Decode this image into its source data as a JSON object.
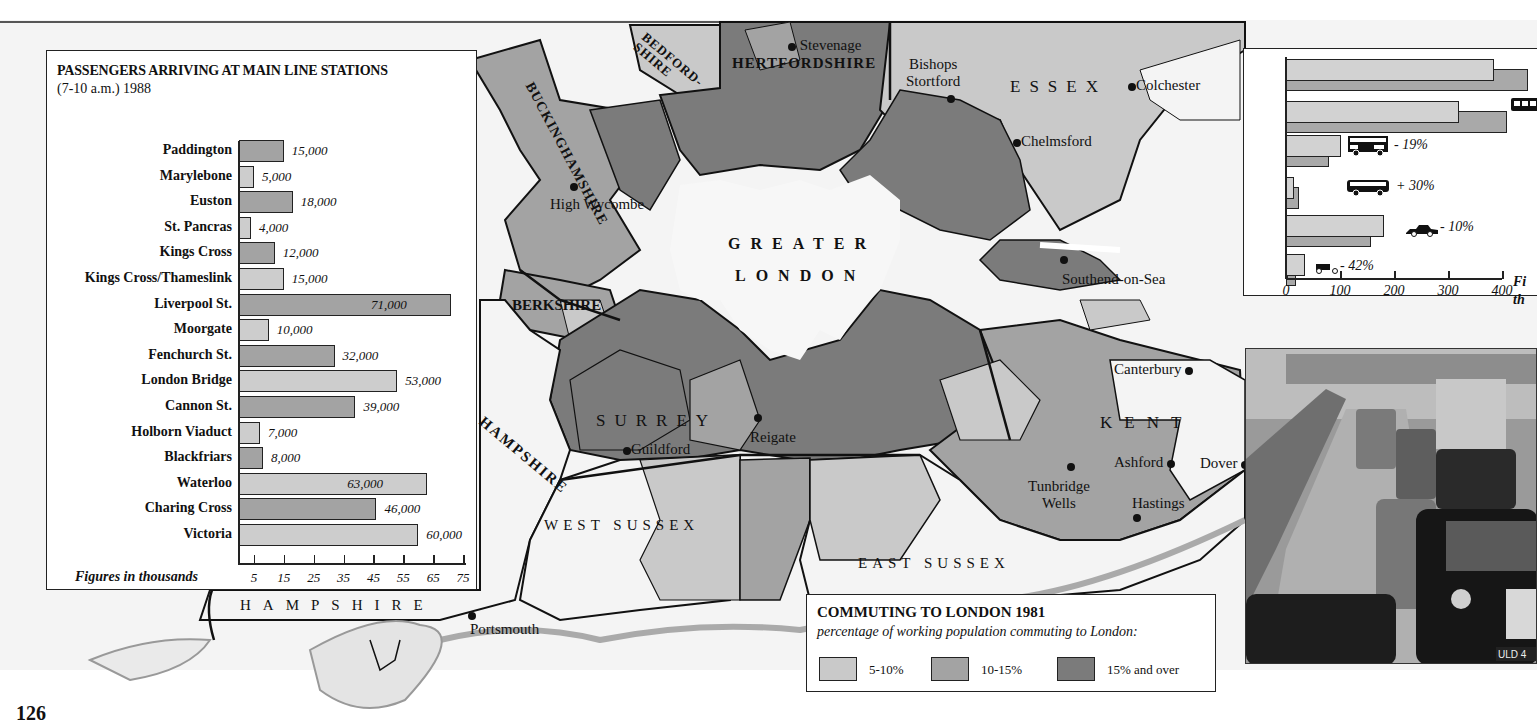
{
  "page": {
    "number": "126"
  },
  "colors": {
    "band_5_10": "#c9c9c9",
    "band_10_15": "#a3a3a3",
    "band_15_plus": "#7b7b7b",
    "greater_london": "#f7f7f7",
    "outside": "#f4f4f4",
    "line": "#111111"
  },
  "map": {
    "counties": {
      "buckinghamshire": "BUCKINGHAMSHIRE",
      "bedfordshire": "BEDFORD-SHIRE",
      "hertfordshire": "HERTFORDSHIRE",
      "essex": "ESSEX",
      "greater_london_1": "GREATER",
      "greater_london_2": "LONDON",
      "berkshire": "BERKSHIRE",
      "surrey": "SURREY",
      "kent": "KENT",
      "hampshire_upper": "HAMPSHIRE",
      "hampshire_lower": "HAMPSHIRE",
      "west_sussex": "WEST SUSSEX",
      "east_sussex": "EAST SUSSEX"
    },
    "towns": {
      "stevenage": "Stevenage",
      "bishops_stortford_1": "Bishops",
      "bishops_stortford_2": "Stortford",
      "colchester": "Colchester",
      "chelmsford": "Chelmsford",
      "high_wycombe": "High Wycombe",
      "southend": "Southend-on-Sea",
      "canterbury": "Canterbury",
      "guildford": "Guildford",
      "reigate": "Reigate",
      "ashford": "Ashford",
      "dover": "Dover",
      "tunbridge_wells_1": "Tunbridge",
      "tunbridge_wells_2": "Wells",
      "hastings": "Hastings",
      "portsmouth": "Portsmouth"
    }
  },
  "legend": {
    "title": "COMMUTING TO LONDON 1981",
    "subtitle": "percentage of working population commuting to London:",
    "items": [
      {
        "label": "5-10%",
        "color": "#c9c9c9"
      },
      {
        "label": "10-15%",
        "color": "#a3a3a3"
      },
      {
        "label": "15% and over",
        "color": "#7b7b7b"
      }
    ]
  },
  "chart_data": [
    {
      "type": "bar",
      "orientation": "horizontal",
      "title": "PASSENGERS ARRIVING AT MAIN LINE STATIONS",
      "subtitle": "(7-10 a.m.) 1988",
      "xlabel": "Figures in thousands",
      "ylabel": "",
      "xlim": [
        0,
        75
      ],
      "xticks": [
        "5",
        "15",
        "25",
        "35",
        "45",
        "55",
        "65",
        "75"
      ],
      "grid": false,
      "categories": [
        "Paddington",
        "Marylebone",
        "Euston",
        "St. Pancras",
        "Kings Cross",
        "Kings Cross/Thameslink",
        "Liverpool St.",
        "Moorgate",
        "Fenchurch St.",
        "London Bridge",
        "Cannon St.",
        "Holborn Viaduct",
        "Blackfriars",
        "Waterloo",
        "Charing Cross",
        "Victoria"
      ],
      "values": [
        15,
        5,
        18,
        4,
        12,
        15,
        71,
        10,
        32,
        53,
        39,
        7,
        8,
        63,
        46,
        60
      ],
      "value_labels": [
        "15,000",
        "5,000",
        "18,000",
        "4,000",
        "12,000",
        "15,000",
        "71,000",
        "10,000",
        "32,000",
        "53,000",
        "39,000",
        "7,000",
        "8,000",
        "63,000",
        "46,000",
        "60,000"
      ],
      "label_inside": [
        false,
        false,
        false,
        false,
        false,
        false,
        true,
        false,
        false,
        false,
        false,
        false,
        false,
        true,
        false,
        false
      ],
      "bar_shades": [
        "dark",
        "light",
        "dark",
        "light",
        "dark",
        "light",
        "dark",
        "light",
        "dark",
        "light",
        "dark",
        "light",
        "dark",
        "light",
        "dark",
        "light"
      ]
    },
    {
      "type": "bar",
      "orientation": "horizontal",
      "title": "",
      "xlabel": "Fi… th… (cropped)",
      "xlim": [
        0,
        400
      ],
      "xticks": [
        "0",
        "100",
        "200",
        "300",
        "400"
      ],
      "grid": false,
      "categories": [
        "(cropped row 1)",
        "rail",
        "bus (double-decker)",
        "coach",
        "car",
        "motorcycle"
      ],
      "series": [
        {
          "name": "earlier year (light)",
          "values": [
            385,
            320,
            102,
            14,
            182,
            35
          ]
        },
        {
          "name": "later year (dark)",
          "values": [
            449,
            409,
            80,
            24,
            158,
            18
          ]
        }
      ],
      "change_labels": [
        "",
        "",
        "-19%",
        "+30%",
        "-10%",
        "-42%"
      ]
    }
  ],
  "transport": {
    "pct_labels": {
      "bus": "- 19%",
      "coach": "+ 30%",
      "car": "- 10%",
      "moto": "- 42%"
    },
    "axis": [
      "0",
      "100",
      "200",
      "300",
      "400"
    ],
    "note_1": "Fi",
    "note_2": "th"
  },
  "photo": {
    "plate": "ULD 4"
  }
}
